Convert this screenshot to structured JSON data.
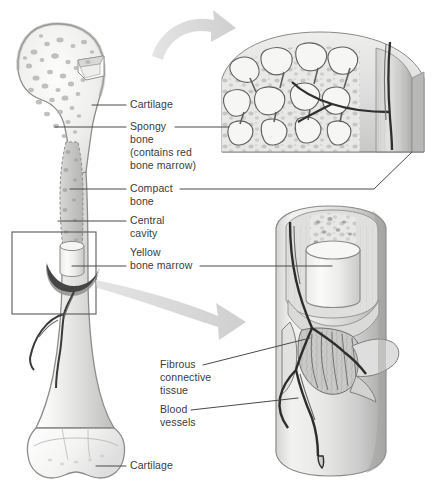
{
  "figure": {
    "background_color": "#ffffff",
    "text_color": "#3b3b3b",
    "leader_line_color": "#4a4a4a",
    "arrow_color": "#d6d6d6",
    "callout_box_color": "#5a5a5a"
  },
  "labels": {
    "cartilage_top": "Cartilage",
    "spongy_bone_l1": "Spongy",
    "spongy_bone_l2": "bone",
    "spongy_bone_l3": "(contains red",
    "spongy_bone_l4": "bone marrow)",
    "compact_bone_l1": "Compact",
    "compact_bone_l2": "bone",
    "central_cavity_l1": "Central",
    "central_cavity_l2": "cavity",
    "yellow_marrow_l1": "Yellow",
    "yellow_marrow_l2": "bone marrow",
    "fibrous_tissue_l1": "Fibrous",
    "fibrous_tissue_l2": "connective",
    "fibrous_tissue_l3": "tissue",
    "blood_vessels_l1": "Blood",
    "blood_vessels_l2": "vessels",
    "cartilage_bottom": "Cartilage"
  },
  "structures": {
    "whole_bone": "femur-longitudinal-section",
    "inset_top": "spongy-bone-trabeculae-detail",
    "inset_bottom": "bone-shaft-marrow-vessel-detail",
    "callout_box": "shaft-region-of-interest",
    "arrow_top": "magnify-arrow-to-spongy-inset",
    "arrow_bottom": "magnify-arrow-to-shaft-inset"
  }
}
